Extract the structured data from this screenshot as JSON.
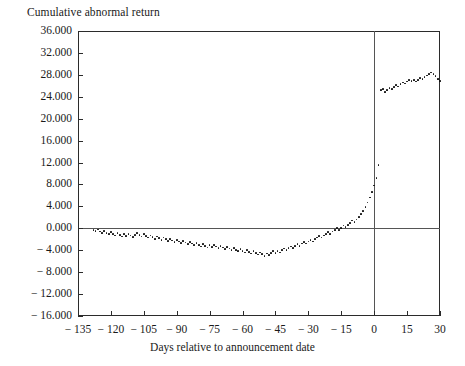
{
  "chart": {
    "ylabel": "Cumulative abnormal return",
    "xlabel": "Days relative to announcement date"
  },
  "chart_data": {
    "type": "scatter",
    "title": "",
    "ylabel": "Cumulative abnormal return",
    "xlabel": "Days relative to announcement date",
    "xlim": [
      -135,
      30
    ],
    "ylim": [
      -16,
      36
    ],
    "grid": false,
    "legend": null,
    "xticks": [
      -135,
      -120,
      -105,
      -90,
      -75,
      -60,
      -45,
      -30,
      -15,
      0,
      15,
      30
    ],
    "xtick_labels": [
      "− 135",
      "− 120",
      "− 105",
      "− 90",
      "− 75",
      "− 60",
      "− 45",
      "− 30",
      "− 15",
      "0",
      "15",
      "30"
    ],
    "yticks": [
      -16,
      -12,
      -8,
      -4,
      0,
      4,
      8,
      12,
      16,
      20,
      24,
      28,
      32,
      36
    ],
    "ytick_labels": [
      "− 16.000",
      "− 12.000",
      "− 8.000",
      "− 4.000",
      "0.000",
      "4.000",
      "8.000",
      "12.000",
      "16.000",
      "20.000",
      "24.000",
      "28.000",
      "32.000",
      "36.000"
    ],
    "annotations": [
      {
        "type": "hline",
        "y": 0,
        "label": "zero abnormal return reference line"
      },
      {
        "type": "vline",
        "x": 0,
        "label": "announcement date"
      }
    ],
    "marker": "dot",
    "color": "#111111",
    "x": [
      -128,
      -127,
      -126,
      -125,
      -124,
      -123,
      -122,
      -121,
      -120,
      -119,
      -118,
      -117,
      -116,
      -115,
      -114,
      -113,
      -112,
      -111,
      -110,
      -109,
      -108,
      -107,
      -106,
      -105,
      -104,
      -103,
      -102,
      -101,
      -100,
      -99,
      -98,
      -97,
      -96,
      -95,
      -94,
      -93,
      -92,
      -91,
      -90,
      -89,
      -88,
      -87,
      -86,
      -85,
      -84,
      -83,
      -82,
      -81,
      -80,
      -79,
      -78,
      -77,
      -76,
      -75,
      -74,
      -73,
      -72,
      -71,
      -70,
      -69,
      -68,
      -67,
      -66,
      -65,
      -64,
      -63,
      -62,
      -61,
      -60,
      -59,
      -58,
      -57,
      -56,
      -55,
      -54,
      -53,
      -52,
      -51,
      -50,
      -49,
      -48,
      -47,
      -46,
      -45,
      -44,
      -43,
      -42,
      -41,
      -40,
      -39,
      -38,
      -37,
      -36,
      -35,
      -34,
      -33,
      -32,
      -31,
      -30,
      -29,
      -28,
      -27,
      -26,
      -25,
      -24,
      -23,
      -22,
      -21,
      -20,
      -19,
      -18,
      -17,
      -16,
      -15,
      -14,
      -13,
      -12,
      -11,
      -10,
      -9,
      -8,
      -7,
      -6,
      -5,
      -4,
      -3,
      -2,
      -1,
      0,
      1,
      2,
      3,
      4,
      5,
      6,
      7,
      8,
      9,
      10,
      11,
      12,
      13,
      14,
      15,
      16,
      17,
      18,
      19,
      20,
      21,
      22,
      23,
      24,
      25,
      26,
      27,
      28,
      29,
      30
    ],
    "y": [
      -0.3,
      -0.5,
      -0.2,
      -0.6,
      -0.9,
      -0.5,
      -0.8,
      -1.1,
      -0.7,
      -1.0,
      -1.3,
      -0.9,
      -1.2,
      -1.5,
      -1.1,
      -1.4,
      -1.0,
      -1.3,
      -1.6,
      -1.2,
      -0.9,
      -1.2,
      -1.5,
      -1.1,
      -1.4,
      -1.7,
      -1.3,
      -1.6,
      -1.9,
      -1.5,
      -1.8,
      -2.1,
      -1.7,
      -2.0,
      -2.3,
      -1.9,
      -2.2,
      -2.5,
      -2.1,
      -2.4,
      -2.7,
      -2.3,
      -2.6,
      -2.9,
      -2.5,
      -2.8,
      -3.1,
      -2.7,
      -3.0,
      -3.3,
      -2.9,
      -3.2,
      -3.5,
      -3.1,
      -3.4,
      -3.0,
      -3.3,
      -3.6,
      -3.2,
      -3.5,
      -3.8,
      -3.4,
      -3.7,
      -4.0,
      -3.6,
      -3.9,
      -4.2,
      -3.8,
      -4.1,
      -4.4,
      -4.0,
      -4.3,
      -4.6,
      -4.2,
      -4.5,
      -4.8,
      -4.4,
      -4.7,
      -5.0,
      -4.6,
      -4.9,
      -4.5,
      -4.2,
      -4.5,
      -4.1,
      -4.4,
      -4.0,
      -3.7,
      -4.0,
      -3.6,
      -3.3,
      -3.6,
      -3.2,
      -2.9,
      -3.2,
      -2.8,
      -2.5,
      -2.8,
      -2.4,
      -2.1,
      -2.4,
      -2.0,
      -1.7,
      -1.4,
      -1.7,
      -1.3,
      -1.0,
      -0.7,
      -1.0,
      -0.6,
      -0.3,
      0.0,
      -0.3,
      0.1,
      0.5,
      0.2,
      0.6,
      1.0,
      1.4,
      1.1,
      1.6,
      2.1,
      2.6,
      3.2,
      3.9,
      4.7,
      5.6,
      6.6,
      7.8,
      9.2,
      11.5,
      25.2,
      25.4,
      24.9,
      25.2,
      25.6,
      25.4,
      25.8,
      26.1,
      25.9,
      26.3,
      26.6,
      26.4,
      26.8,
      27.1,
      26.9,
      27.0,
      26.8,
      27.1,
      27.4,
      27.2,
      27.6,
      27.9,
      28.1,
      28.4,
      28.2,
      27.8,
      27.3,
      26.9,
      27.2,
      26.9,
      27.1
    ]
  }
}
